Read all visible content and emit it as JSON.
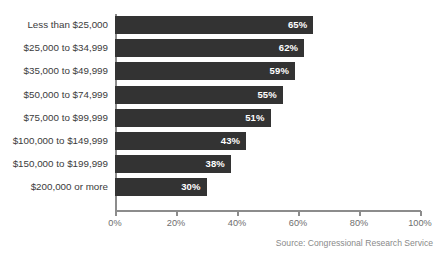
{
  "chart_data": {
    "type": "bar",
    "orientation": "horizontal",
    "title": "",
    "subtitle": "",
    "xlabel": "",
    "ylabel": "",
    "categories": [
      "Less than $25,000",
      "$25,000 to $34,999",
      "$35,000 to $49,999",
      "$50,000 to $74,999",
      "$75,000 to $99,999",
      "$100,000 to $149,999",
      "$150,000 to $199,999",
      "$200,000 or more"
    ],
    "values": [
      65,
      62,
      59,
      55,
      51,
      43,
      38,
      30
    ],
    "value_labels": [
      "65%",
      "62%",
      "59%",
      "55%",
      "51%",
      "43%",
      "38%",
      "30%"
    ],
    "xlim": [
      0,
      100
    ],
    "xticks": [
      0,
      20,
      40,
      60,
      80,
      100
    ],
    "xtick_labels": [
      "0%",
      "20%",
      "40%",
      "60%",
      "80%",
      "100%"
    ],
    "grid": false,
    "legend": "none",
    "bar_color": "#333333",
    "value_label_color": "#ffffff",
    "axis_color": "#8c8c8c",
    "category_label_color": "#3b3b3b",
    "tick_label_color": "#6e6e6e"
  },
  "source_note": "Source: Congressional Research Service"
}
